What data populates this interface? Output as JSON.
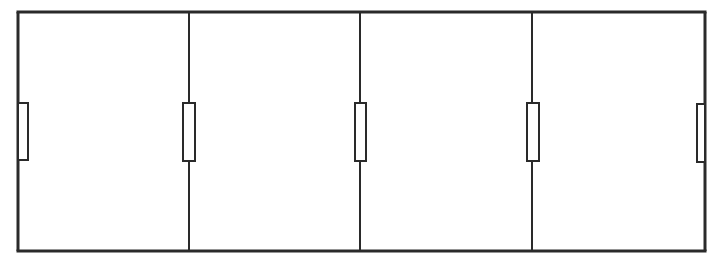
{
  "diagram": {
    "type": "circuit",
    "colors": {
      "background": "#ffffff",
      "stroke": "#2a2a2a"
    },
    "rails": {
      "top_y": 12,
      "bottom_y": 251,
      "left_x": 18,
      "right_x": 705
    },
    "branches": [
      {
        "id": "R1",
        "x": 18,
        "resistor": {
          "x": 18,
          "y": 103,
          "w": 10,
          "h": 57
        }
      },
      {
        "id": "R2",
        "x": 189,
        "resistor": {
          "x": 183,
          "y": 103,
          "w": 12,
          "h": 58
        }
      },
      {
        "id": "R3",
        "x": 360,
        "resistor": {
          "x": 355,
          "y": 103,
          "w": 11,
          "h": 58
        }
      },
      {
        "id": "R4",
        "x": 532,
        "resistor": {
          "x": 527,
          "y": 103,
          "w": 12,
          "h": 58
        }
      },
      {
        "id": "R5",
        "x": 705,
        "resistor": {
          "x": 697,
          "y": 104,
          "w": 8,
          "h": 58
        }
      }
    ]
  }
}
